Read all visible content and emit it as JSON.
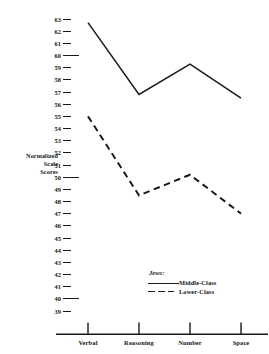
{
  "chart_data": {
    "type": "line",
    "title": "",
    "xlabel": "",
    "ylabel": "Normalized Scale Scores",
    "ylabel_lines": [
      "Normalized",
      "Scale",
      "Scores"
    ],
    "categories": [
      "Verbal",
      "Reasoning",
      "Number",
      "Space"
    ],
    "ylim": [
      39,
      63
    ],
    "yticks": [
      39,
      40,
      41,
      42,
      43,
      44,
      45,
      46,
      47,
      48,
      49,
      50,
      51,
      52,
      53,
      54,
      55,
      56,
      57,
      58,
      59,
      60,
      61,
      62,
      63
    ],
    "major_yticks": [
      40,
      50,
      60
    ],
    "grid": false,
    "legend_position": "inside-bottom-right",
    "legend_title": "Jews:",
    "series": [
      {
        "name": "Middle-Class",
        "style": "solid",
        "color": "#1a1a1a",
        "values": [
          62.7,
          56.8,
          59.3,
          56.5
        ]
      },
      {
        "name": "Lower-Class",
        "style": "dashed",
        "color": "#1a1a1a",
        "values": [
          55.0,
          48.5,
          50.2,
          47.0
        ]
      }
    ]
  },
  "legend": {
    "title": "Jews:",
    "entries": [
      {
        "label": "Middle-Class",
        "style": "solid"
      },
      {
        "label": "Lower-Class",
        "style": "dashed"
      }
    ]
  },
  "axes": {
    "y_title_lines": [
      "Normalized",
      "Scale",
      "Scores"
    ],
    "x_categories": [
      "Verbal",
      "Reasoning",
      "Number",
      "Space"
    ]
  },
  "colors": {
    "ink": "#1a1a1a",
    "background": "#ffffff"
  }
}
